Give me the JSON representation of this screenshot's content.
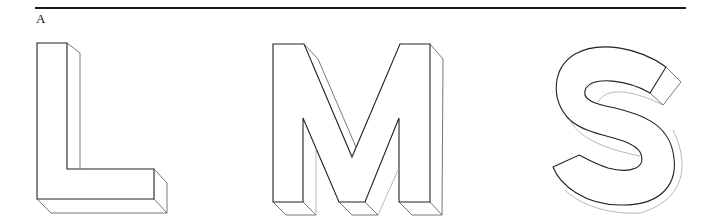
{
  "figure": {
    "panel_label": "A",
    "letters": [
      {
        "char": "L",
        "style": "3d-extruded-outline"
      },
      {
        "char": "M",
        "style": "3d-extruded-outline"
      },
      {
        "char": "S",
        "style": "3d-extruded-outline"
      }
    ],
    "line_color": "#222222",
    "background": "#ffffff"
  }
}
